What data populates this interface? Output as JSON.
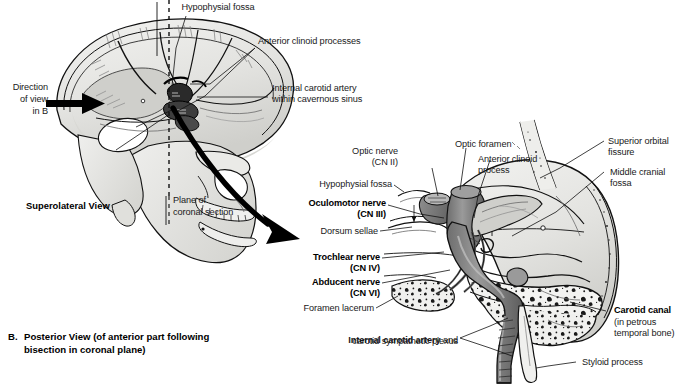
{
  "figure": {
    "background_color": "#ffffff",
    "ink_color": "#000000",
    "bone_fill": "#e8e8e6",
    "bone_shadow": "#c9c9c6",
    "vessel_fill": "#8a8a8a",
    "vessel_dark": "#5e5e5e"
  },
  "panel_a": {
    "view_name": "Superolateral View",
    "direction_arrow": {
      "line1": "Direction",
      "line2": "of view",
      "line3": "in B"
    },
    "labels": [
      {
        "id": "hypophysial-fossa-a",
        "text": "Hypophysial fossa"
      },
      {
        "id": "anterior-clinoid-processes-a",
        "text": "Anterior clinoid processes"
      },
      {
        "id": "internal-carotid-artery-a-l1",
        "text": "Internal carotid artery"
      },
      {
        "id": "internal-carotid-artery-a-l2",
        "text": "within cavernous sinus"
      },
      {
        "id": "plane-of-coronal-section-l1",
        "text": "Plane of"
      },
      {
        "id": "plane-of-coronal-section-l2",
        "text": "coronal section"
      }
    ]
  },
  "panel_b": {
    "caption_letter": "B.",
    "caption_line1": "Posterior View (of anterior part following",
    "caption_line2": "bisection in coronal plane)",
    "labels_left": [
      {
        "id": "optic-nerve",
        "line1": "Optic nerve",
        "line2": "(CN II)",
        "bold": false
      },
      {
        "id": "hypophysial-fossa-b",
        "line1": "Hypophysial fossa",
        "line2": "",
        "bold": false
      },
      {
        "id": "oculomotor-nerve",
        "line1": "Oculomotor nerve",
        "line2": "(CN III)",
        "bold": true
      },
      {
        "id": "dorsum-sellae",
        "line1": "Dorsum sellae",
        "line2": "",
        "bold": false
      },
      {
        "id": "trochlear-nerve",
        "line1": "Trochlear nerve",
        "line2": "(CN IV)",
        "bold": true
      },
      {
        "id": "abducent-nerve",
        "line1": "Abducent nerve",
        "line2": "(CN VI)",
        "bold": true
      },
      {
        "id": "foramen-lacerum",
        "line1": "Foramen lacerum",
        "line2": "",
        "bold": false
      }
    ],
    "label_internal_carotid": {
      "id": "internal-carotid-artery-b",
      "bold_part": "Internal carotid artery",
      "plain_part": " and",
      "line2": "carotid sympathetic plexus"
    },
    "labels_top": [
      {
        "id": "optic-foramen",
        "line1": "Optic foramen",
        "line2": ""
      },
      {
        "id": "anterior-clinoid-process-b",
        "line1": "Anterior clinoid",
        "line2": "process"
      }
    ],
    "labels_right": [
      {
        "id": "superior-orbital-fissure",
        "line1": "Superior orbital",
        "line2": "fissure",
        "bold": false
      },
      {
        "id": "middle-cranial-fossa",
        "line1": "Middle cranial",
        "line2": "fossa",
        "bold": false
      },
      {
        "id": "carotid-canal",
        "line1": "Carotid canal",
        "line2": "(in petrous",
        "line3": "temporal bone)",
        "bold": true
      },
      {
        "id": "styloid-process",
        "line1": "Styloid process",
        "line2": "",
        "bold": false
      }
    ]
  }
}
